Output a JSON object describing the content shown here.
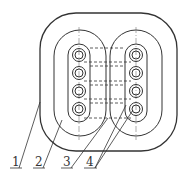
{
  "diagram": {
    "type": "cable cross-section",
    "stroke_color": "#333333",
    "labels": [
      {
        "id": "1",
        "text": "1",
        "target": "outer sheath"
      },
      {
        "id": "2",
        "text": "2",
        "target": "inner insulation layer"
      },
      {
        "id": "3",
        "text": "3",
        "target": "conductor group insulation"
      },
      {
        "id": "4",
        "text": "4",
        "target": "conductors"
      }
    ],
    "conductor_columns": 2,
    "conductors_per_column": 4
  }
}
